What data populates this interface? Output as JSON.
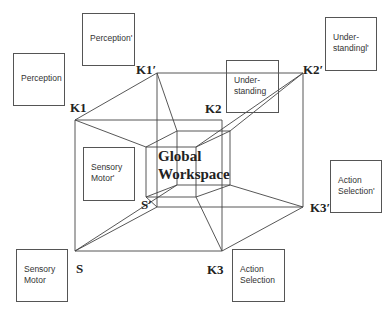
{
  "diagram": {
    "center_label": "Global\nWorkspace",
    "boxes": [
      {
        "id": "perception",
        "label": "Perception",
        "x": 13,
        "y": 53,
        "w": 52,
        "h": 53
      },
      {
        "id": "perception-prime",
        "label": "Perception'",
        "x": 82,
        "y": 13,
        "w": 53,
        "h": 53
      },
      {
        "id": "understanding",
        "label": "Under-\nstanding",
        "x": 226,
        "y": 60,
        "w": 53,
        "h": 53
      },
      {
        "id": "understanding-prime",
        "label": "Under-\nstandingl'",
        "x": 325,
        "y": 17,
        "w": 52,
        "h": 54
      },
      {
        "id": "sensory-motor-prime",
        "label": "Sensory\nMotor'",
        "x": 83,
        "y": 147,
        "w": 52,
        "h": 54
      },
      {
        "id": "action-selection-prime",
        "label": "Action\nSelection'",
        "x": 330,
        "y": 160,
        "w": 52,
        "h": 53
      },
      {
        "id": "sensory-motor",
        "label": "Sensory\nMotor",
        "x": 16,
        "y": 249,
        "w": 52,
        "h": 53
      },
      {
        "id": "action-selection",
        "label": "Action\nSelection",
        "x": 232,
        "y": 249,
        "w": 53,
        "h": 53
      }
    ],
    "vertex_labels": [
      {
        "id": "K1",
        "label": "K1",
        "x": 70,
        "y": 100
      },
      {
        "id": "K1-prime",
        "label": "K1′",
        "x": 136,
        "y": 62
      },
      {
        "id": "K2",
        "label": "K2",
        "x": 205,
        "y": 101
      },
      {
        "id": "K2-prime",
        "label": "K2′",
        "x": 303,
        "y": 62
      },
      {
        "id": "K3",
        "label": "K3",
        "x": 207,
        "y": 262
      },
      {
        "id": "K3-prime",
        "label": "K3′",
        "x": 310,
        "y": 200
      },
      {
        "id": "S",
        "label": "S",
        "x": 76,
        "y": 261
      },
      {
        "id": "S-prime",
        "label": "S′",
        "x": 141,
        "y": 197
      }
    ],
    "vertices": {
      "S": [
        75,
        251
      ],
      "K1": [
        75,
        120
      ],
      "K2": [
        222,
        120
      ],
      "K3": [
        222,
        251
      ],
      "Sp": [
        157,
        207
      ],
      "K1p": [
        157,
        73
      ],
      "K2p": [
        303,
        73
      ],
      "K3p": [
        303,
        207
      ],
      "fTL": [
        146,
        147
      ],
      "fTR": [
        196,
        147
      ],
      "fBR": [
        196,
        197
      ],
      "fBL": [
        146,
        197
      ],
      "bTL": [
        177,
        131
      ],
      "bTR": [
        230,
        131
      ],
      "bBR": [
        230,
        185
      ],
      "bBL": [
        177,
        185
      ]
    },
    "edges": [
      [
        "S",
        "K1"
      ],
      [
        "K1",
        "K2"
      ],
      [
        "K2",
        "K3"
      ],
      [
        "K3",
        "S"
      ],
      [
        "Sp",
        "K1p"
      ],
      [
        "K1p",
        "K2p"
      ],
      [
        "K2p",
        "K3p"
      ],
      [
        "K3p",
        "Sp"
      ],
      [
        "K1",
        "K1p"
      ],
      [
        "K3",
        "K3p"
      ],
      [
        "S",
        "Sp"
      ],
      [
        "fTL",
        "fTR"
      ],
      [
        "fTR",
        "fBR"
      ],
      [
        "fBR",
        "fBL"
      ],
      [
        "fBL",
        "fTL"
      ],
      [
        "bTL",
        "bTR"
      ],
      [
        "bTR",
        "bBR"
      ],
      [
        "bBR",
        "bBL"
      ],
      [
        "bBL",
        "bTL"
      ],
      [
        "fTL",
        "bTL"
      ],
      [
        "fTR",
        "bTR"
      ],
      [
        "fBR",
        "bBR"
      ],
      [
        "fBL",
        "bBL"
      ],
      [
        "K1",
        "fTL"
      ],
      [
        "K1p",
        "bTL"
      ],
      [
        "K2p",
        "fTR"
      ],
      [
        "K2p",
        "bTR"
      ],
      [
        "K3",
        "fBR"
      ],
      [
        "K3p",
        "bBR"
      ],
      [
        "S",
        "bBL"
      ],
      [
        "Sp",
        "fBL"
      ]
    ],
    "line_color": "#444444"
  }
}
